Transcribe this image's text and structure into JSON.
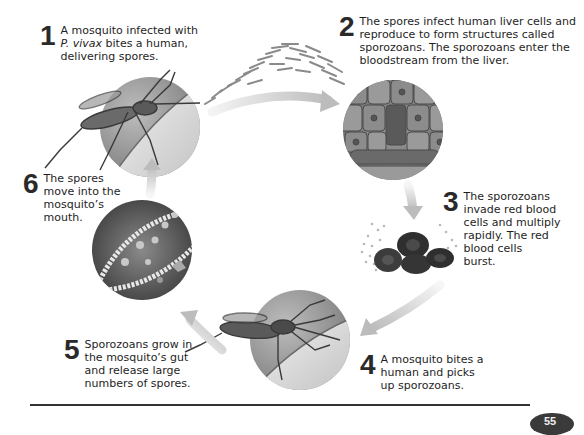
{
  "diagram": {
    "steps": [
      {
        "number": "1",
        "text_pre": "A mosquito infected with\n",
        "text_italic": "P. vivax",
        "text_post": " bites a human,\ndelivering spores."
      },
      {
        "number": "2",
        "text": "The spores infect human liver cells and\nreproduce to form structures called\nsporozoans. The sporozoans enter the\nbloodstream from the liver."
      },
      {
        "number": "3",
        "text": "The sporozoans\ninvade red blood\ncells and multiply\nrapidly. The red\nblood cells\nburst."
      },
      {
        "number": "4",
        "text": "A mosquito bites a\nhuman and picks\nup sporozoans."
      },
      {
        "number": "5",
        "text": "Sporozoans grow in\nthe mosquito’s gut\nand release large\nnumbers of spores."
      },
      {
        "number": "6",
        "text": "The spores\nmove into the\nmosquito’s\nmouth."
      }
    ],
    "illustrations": [
      "mosquito-biting-skin",
      "liver-cells",
      "bursting-red-blood-cells",
      "mosquito-biting-skin",
      "mosquito-gut-with-spores"
    ],
    "colors": {
      "arrow": "#c8c8c8",
      "circle_light": "#d8d8d8",
      "circle_dark": "#5a5a5a",
      "rule": "#333333",
      "number": "#2a2a2a"
    }
  },
  "footer": {
    "page_number": "55"
  }
}
